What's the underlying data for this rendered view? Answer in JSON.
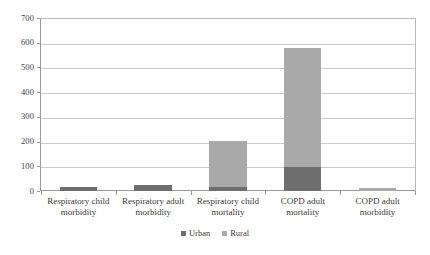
{
  "chart_data": {
    "type": "bar",
    "subtype": "stacked-column",
    "title": "",
    "subtitle": "",
    "xlabel": "",
    "ylabel": "",
    "categories": [
      "Respiratory child morbidity",
      "Respiratory adult morbidity",
      "Respiratory child mortality",
      "COPD adult mortality",
      "COPD adult morbidity"
    ],
    "series": [
      {
        "name": "Urban",
        "color": "#6e6e6e",
        "values": [
          18,
          25,
          16,
          97,
          0
        ]
      },
      {
        "name": "Rural",
        "color": "#a9a9a9",
        "values": [
          0,
          0,
          187,
          482,
          12
        ]
      }
    ],
    "totals": [
      18,
      25,
      203,
      579,
      12
    ],
    "ylim": [
      0,
      700
    ],
    "ytick_step": 100,
    "yticks": [
      0,
      100,
      200,
      300,
      400,
      500,
      600,
      700
    ],
    "ytick_labels": [
      "0",
      "100",
      "200",
      "300",
      "400",
      "500",
      "600",
      "700"
    ],
    "grid": true,
    "grid_axis": "y",
    "legend_position": "bottom",
    "legend_entries": [
      "Urban",
      "Rural"
    ],
    "annotations": []
  },
  "colors": {
    "urban": "#6e6e6e",
    "rural": "#a9a9a9",
    "gridline": "#c9c9c9",
    "axis": "#9a9a9a",
    "text": "#3a3a3a",
    "background": "#ffffff"
  }
}
